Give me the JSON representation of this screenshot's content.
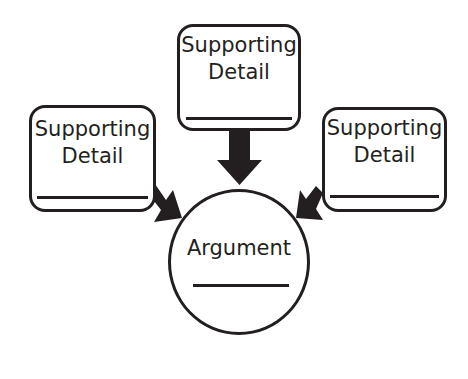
{
  "diagram": {
    "title": "",
    "boxes": {
      "top": {
        "label_line1": "Supporting",
        "label_line2": "Detail",
        "blank": ""
      },
      "left": {
        "label_line1": "Supporting",
        "label_line2": "Detail",
        "blank": ""
      },
      "right": {
        "label_line1": "Supporting",
        "label_line2": "Detail",
        "blank": ""
      }
    },
    "center": {
      "label": "Argument",
      "blank": ""
    },
    "colors": {
      "stroke": "#231f20",
      "background": "#ffffff"
    },
    "arrows": [
      {
        "from": "top",
        "to": "center",
        "icon": "arrow-down-icon"
      },
      {
        "from": "left",
        "to": "center",
        "icon": "arrow-down-right-icon"
      },
      {
        "from": "right",
        "to": "center",
        "icon": "arrow-down-left-icon"
      }
    ]
  }
}
